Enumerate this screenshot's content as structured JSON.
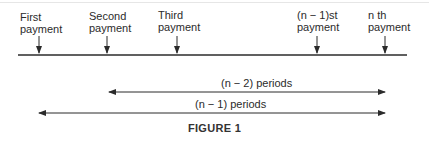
{
  "figure": {
    "caption": "FIGURE 1",
    "timeline": {
      "payments": [
        {
          "line1": "First",
          "line2": "payment",
          "x": 39
        },
        {
          "line1": "Second",
          "line2": "payment",
          "x": 107
        },
        {
          "line1": "Third",
          "line2": "payment",
          "x": 177
        },
        {
          "line1_italic": "n",
          "line1": "(n − 1)st",
          "line2": "payment",
          "x": 317
        },
        {
          "line1": "n th",
          "line2": "payment",
          "x": 385
        }
      ]
    },
    "spans": [
      {
        "label": "(n − 2) periods",
        "from": "Second payment",
        "to": "n th payment"
      },
      {
        "label": "(n − 1) periods",
        "from": "First payment",
        "to": "n th payment"
      }
    ],
    "colors": {
      "ink": "#2b2b2b",
      "background": "#ffffff"
    }
  }
}
